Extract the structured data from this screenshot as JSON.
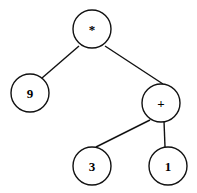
{
  "diagram": {
    "type": "expression-tree",
    "nodes": [
      {
        "id": "root",
        "label": "*",
        "cx": 92,
        "cy": 29,
        "r": 19
      },
      {
        "id": "n9",
        "label": "9",
        "cx": 30,
        "cy": 93,
        "r": 19
      },
      {
        "id": "plus",
        "label": "+",
        "cx": 161,
        "cy": 103,
        "r": 19
      },
      {
        "id": "n3",
        "label": "3",
        "cx": 92,
        "cy": 166,
        "r": 19
      },
      {
        "id": "n1",
        "label": "1",
        "cx": 168,
        "cy": 166,
        "r": 19
      }
    ],
    "edges": [
      {
        "from": "root",
        "to": "n9"
      },
      {
        "from": "root",
        "to": "plus"
      },
      {
        "from": "plus",
        "to": "n3"
      },
      {
        "from": "plus",
        "to": "n1"
      }
    ]
  }
}
